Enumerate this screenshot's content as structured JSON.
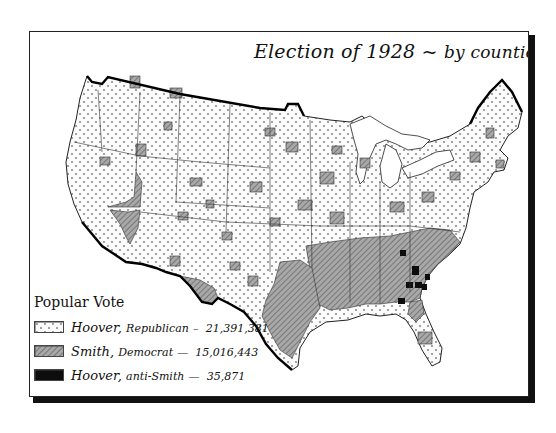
{
  "map": {
    "title": "Election of 1928",
    "title_separator": "~",
    "subtitle": "by counties",
    "colors": {
      "hoover_republican": "#f4f4f4",
      "smith_democrat": "#9a9a9a",
      "hoover_anti_smith": "#0d0d0d",
      "border": "#222222"
    }
  },
  "legend": {
    "title": "Popular Vote",
    "items": [
      {
        "candidate": "Hoover,",
        "party": "Republican",
        "dash": "–",
        "votes": "21,391,381",
        "pattern": "dotted"
      },
      {
        "candidate": "Smith,",
        "party": "Democrat",
        "dash": "—",
        "votes": "15,016,443",
        "pattern": "hatched"
      },
      {
        "candidate": "Hoover,",
        "party": "anti-Smith",
        "dash": "—",
        "votes": "35,871",
        "pattern": "solid-black"
      }
    ]
  }
}
